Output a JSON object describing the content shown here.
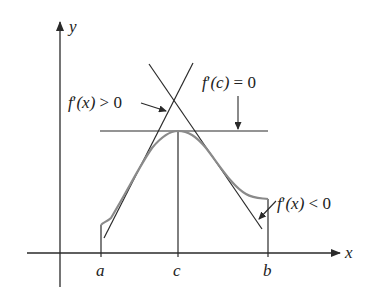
{
  "diagram": {
    "axes": {
      "x_label": "x",
      "y_label": "y"
    },
    "ticks": {
      "a": "a",
      "c": "c",
      "b": "b"
    },
    "annotations": {
      "increasing": {
        "f": "f",
        "prime": "′",
        "arg": "(x)",
        "rel": " > 0"
      },
      "critical": {
        "f": "f",
        "prime": "′",
        "arg": "(c)",
        "rel": " = 0"
      },
      "decreasing": {
        "f": "f",
        "prime": "′",
        "arg": "(x)",
        "rel": " < 0"
      }
    },
    "colors": {
      "curve": "#8a8a8a",
      "lines": "#2a2a2a"
    }
  }
}
